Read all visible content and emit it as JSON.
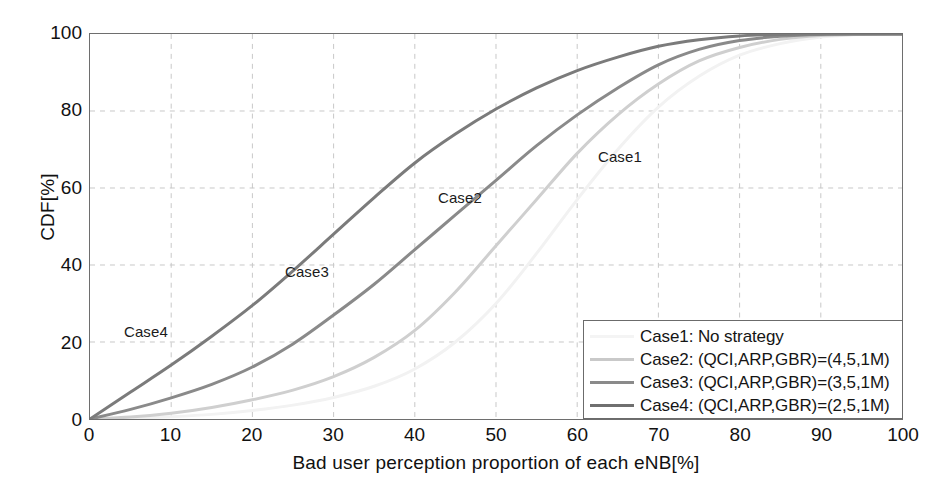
{
  "chart_data": {
    "type": "line",
    "title": "",
    "xlabel": "Bad user perception proportion of each eNB[%]",
    "ylabel": "CDF[%]",
    "xlim": [
      0,
      100
    ],
    "ylim": [
      0,
      100
    ],
    "xticks": [
      "0",
      "10",
      "20",
      "30",
      "40",
      "50",
      "60",
      "70",
      "80",
      "90",
      "100"
    ],
    "yticks": [
      "0",
      "20",
      "40",
      "60",
      "80",
      "100"
    ],
    "grid": true,
    "grid_style": "dashed",
    "legend_position": "lower-right",
    "x": [
      0,
      5,
      10,
      15,
      20,
      25,
      30,
      35,
      40,
      45,
      50,
      55,
      60,
      65,
      70,
      75,
      80,
      85,
      90,
      95,
      100
    ],
    "series": [
      {
        "name": "Case1",
        "label": "Case1: No strategy",
        "color": "#f2f2f2",
        "annotation": "Case1",
        "values": [
          0,
          0.2,
          0.6,
          1.2,
          2.2,
          3.6,
          5.6,
          8.5,
          13.0,
          20.0,
          30.0,
          43.0,
          57.0,
          70.0,
          81.0,
          89.0,
          94.5,
          97.5,
          99.2,
          99.9,
          100
        ]
      },
      {
        "name": "Case2",
        "label": "Case2: (QCI,ARP,GBR)=(4,5,1M)",
        "color": "#cfcfcf",
        "annotation": "Case2",
        "values": [
          0,
          0.5,
          1.5,
          3.0,
          5.0,
          7.5,
          11.0,
          16.0,
          23.0,
          33.0,
          45.0,
          57.0,
          69.0,
          79.0,
          87.0,
          93.0,
          96.5,
          98.6,
          99.6,
          99.9,
          100
        ]
      },
      {
        "name": "Case3",
        "label": "Case3: (QCI,ARP,GBR)=(3,5,1M)",
        "color": "#8a8a8a",
        "annotation": "Case3",
        "values": [
          0,
          2.5,
          5.5,
          9.0,
          13.5,
          19.5,
          27.0,
          35.0,
          44.0,
          53.0,
          62.0,
          71.0,
          79.0,
          86.0,
          92.0,
          96.0,
          98.3,
          99.4,
          99.9,
          100,
          100
        ]
      },
      {
        "name": "Case4",
        "label": "Case4: (QCI,ARP,GBR)=(2,5,1M)",
        "color": "#7b7b7b",
        "annotation": "Case4",
        "values": [
          0,
          7.0,
          14.0,
          21.5,
          29.5,
          38.5,
          48.0,
          57.5,
          66.5,
          74.0,
          80.5,
          86.0,
          90.5,
          94.0,
          96.8,
          98.5,
          99.5,
          99.9,
          100,
          100,
          100
        ]
      }
    ]
  },
  "legend": {
    "items": [
      {
        "label": "Case1: No strategy",
        "color": "#f4f4f4"
      },
      {
        "label": "Case2: (QCI,ARP,GBR)=(4,5,1M)",
        "color": "#c9c9c9"
      },
      {
        "label": "Case3: (QCI,ARP,GBR)=(3,5,1M)",
        "color": "#8a8a8a"
      },
      {
        "label": "Case4: (QCI,ARP,GBR)=(2,5,1M)",
        "color": "#6f6f6f"
      }
    ]
  },
  "annotations": [
    {
      "text": "Case1",
      "x": 598,
      "y": 148
    },
    {
      "text": "Case2",
      "x": 438,
      "y": 189
    },
    {
      "text": "Case3",
      "x": 285,
      "y": 263
    },
    {
      "text": "Case4",
      "x": 124,
      "y": 323
    }
  ],
  "colors": {
    "axis": "#6e6e6e",
    "grid": "#c8c8c8",
    "text": "#1a1a1a",
    "background": "#ffffff"
  }
}
